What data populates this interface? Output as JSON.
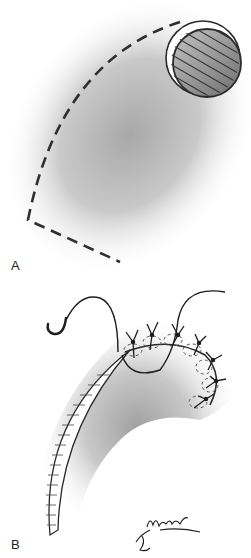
{
  "figure": {
    "panels": [
      {
        "id": "A",
        "label": "A",
        "elements": [
          "circular-defect",
          "dashed-incision-line",
          "shaded-skin-region"
        ]
      },
      {
        "id": "B",
        "label": "B",
        "elements": [
          "curved-needle",
          "suture-thread",
          "rotated-flap",
          "interrupted-sutures",
          "shaded-skin-region"
        ]
      }
    ],
    "signature": "Moorman",
    "colors": {
      "line": "#2a2a2a",
      "shade_dark": "#9a9a9a",
      "shade_light": "#ffffff",
      "defect_fill": "#8c8c8c"
    }
  }
}
